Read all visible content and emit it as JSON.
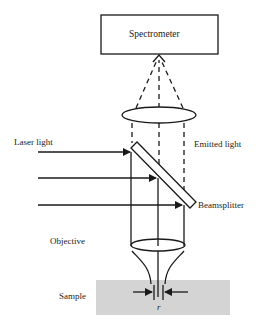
{
  "diagram": {
    "type": "confocal-raman-setup",
    "labels": {
      "spectrometer": "Spectrometer",
      "laser_light": "Laser light",
      "emitted_light": "Emitted light",
      "beamsplitter": "Beamsplitter",
      "objective": "Objective",
      "sample": "Sample",
      "radius": "r"
    },
    "colors": {
      "line": "#1a1a1a",
      "sample_fill": "#d4d4d4",
      "background": "#ffffff"
    },
    "laser_beam_count": 3
  }
}
